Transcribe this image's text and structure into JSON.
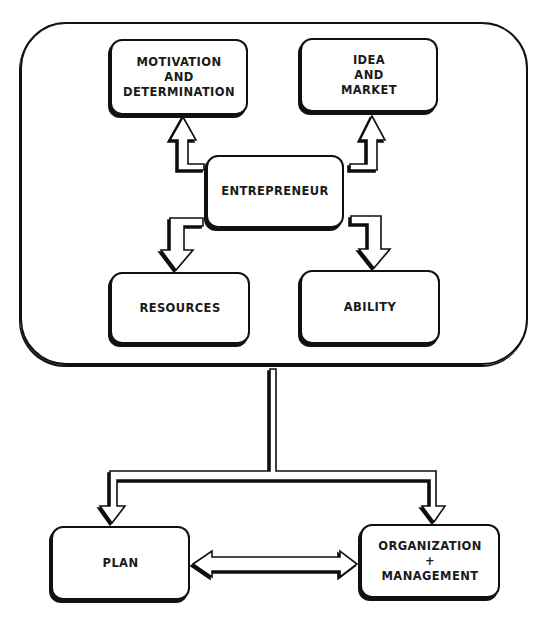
{
  "diagram": {
    "type": "flowchart",
    "colors": {
      "stroke": "#111111",
      "fill": "#ffffff",
      "text": "#1a1a1a"
    },
    "container": {
      "label": ""
    },
    "nodes": {
      "motivation": {
        "label": "MOTIVATION\nAND\nDETERMINATION"
      },
      "idea": {
        "label": "IDEA\nAND\nMARKET"
      },
      "entrepreneur": {
        "label": "ENTREPRENEUR"
      },
      "resources": {
        "label": "RESOURCES"
      },
      "ability": {
        "label": "ABILITY"
      },
      "plan": {
        "label": "PLAN"
      },
      "organization": {
        "label": "ORGANIZATION\n+\nMANAGEMENT"
      }
    },
    "edges": [
      {
        "from": "entrepreneur",
        "to": "motivation",
        "style": "hollow-elbow-arrow"
      },
      {
        "from": "entrepreneur",
        "to": "idea",
        "style": "hollow-elbow-arrow"
      },
      {
        "from": "entrepreneur",
        "to": "resources",
        "style": "hollow-elbow-arrow"
      },
      {
        "from": "entrepreneur",
        "to": "ability",
        "style": "hollow-elbow-arrow"
      },
      {
        "from": "container",
        "to": "plan",
        "style": "hollow-branch-arrow"
      },
      {
        "from": "container",
        "to": "organization",
        "style": "hollow-branch-arrow"
      },
      {
        "from": "plan",
        "to": "organization",
        "style": "hollow-double-arrow",
        "bidirectional": true
      }
    ]
  }
}
